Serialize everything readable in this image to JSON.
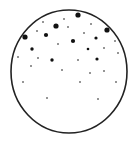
{
  "diagram": {
    "container": {
      "shape": "ellipse",
      "cx": 69,
      "cy": 71.5,
      "rx": 58,
      "ry": 61.5,
      "stroke": "#222222",
      "stroke_width": 1.6,
      "fill": "#ffffff"
    },
    "dot_color": "#111111",
    "particles": [
      {
        "x": 78,
        "y": 15,
        "r": 2.6
      },
      {
        "x": 56,
        "y": 26,
        "r": 2.6
      },
      {
        "x": 107,
        "y": 30,
        "r": 2.6
      },
      {
        "x": 25,
        "y": 37,
        "r": 2.6
      },
      {
        "x": 46,
        "y": 35,
        "r": 2.1
      },
      {
        "x": 73,
        "y": 41,
        "r": 2.1
      },
      {
        "x": 32,
        "y": 49,
        "r": 1.7
      },
      {
        "x": 52,
        "y": 60,
        "r": 1.7
      },
      {
        "x": 97,
        "y": 59,
        "r": 1.6
      },
      {
        "x": 96,
        "y": 38,
        "r": 1.6
      },
      {
        "x": 88,
        "y": 49,
        "r": 1.3
      },
      {
        "x": 43,
        "y": 22,
        "r": 0.8
      },
      {
        "x": 64,
        "y": 19,
        "r": 0.8
      },
      {
        "x": 91,
        "y": 24,
        "r": 0.8
      },
      {
        "x": 68,
        "y": 27,
        "r": 0.8
      },
      {
        "x": 37,
        "y": 31,
        "r": 0.8
      },
      {
        "x": 84,
        "y": 33,
        "r": 0.8
      },
      {
        "x": 58,
        "y": 44,
        "r": 0.8
      },
      {
        "x": 115,
        "y": 41,
        "r": 0.8
      },
      {
        "x": 104,
        "y": 48,
        "r": 0.8
      },
      {
        "x": 118,
        "y": 53,
        "r": 0.8
      },
      {
        "x": 18,
        "y": 57,
        "r": 0.8
      },
      {
        "x": 38,
        "y": 58,
        "r": 0.8
      },
      {
        "x": 78,
        "y": 60,
        "r": 0.8
      },
      {
        "x": 31,
        "y": 66,
        "r": 0.8
      },
      {
        "x": 62,
        "y": 70,
        "r": 0.8
      },
      {
        "x": 90,
        "y": 73,
        "r": 0.8
      },
      {
        "x": 104,
        "y": 71,
        "r": 0.8
      },
      {
        "x": 23,
        "y": 82,
        "r": 0.8
      },
      {
        "x": 80,
        "y": 82,
        "r": 0.8
      },
      {
        "x": 116,
        "y": 82,
        "r": 0.8
      },
      {
        "x": 47,
        "y": 98,
        "r": 0.8
      },
      {
        "x": 98,
        "y": 99,
        "r": 0.8
      }
    ]
  }
}
